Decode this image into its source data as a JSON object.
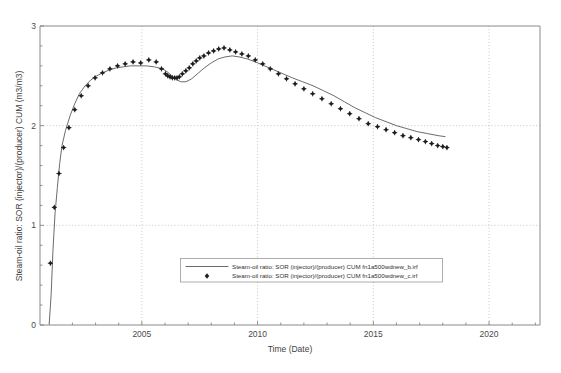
{
  "chart_data": {
    "type": "line",
    "title": "",
    "xlabel": "Time (Date)",
    "ylabel": "Steam-oil ratio: SOR (injector)/(producer) CUM (m3/m3)",
    "xlim": [
      2000.6,
      2022.2
    ],
    "ylim": [
      0,
      3
    ],
    "xticks": [
      2005,
      2010,
      2015,
      2020
    ],
    "xtick_labels": [
      "2005",
      "2010",
      "2015",
      "2020"
    ],
    "yticks": [
      0,
      1,
      2,
      3
    ],
    "ytick_labels": [
      "0",
      "1",
      "2",
      "3"
    ],
    "grid": true,
    "grid_style": "dotted",
    "legend_position": "lower-center-inside",
    "series": [
      {
        "name": "Steam-oil ratio: SOR (injector)/(producer) CUM fn1a500wdnew_b.irf",
        "style": "line",
        "color": "#5a5a5a",
        "x": [
          2001.0,
          2001.08,
          2001.16,
          2001.25,
          2001.35,
          2001.45,
          2001.55,
          2001.7,
          2001.9,
          2002.1,
          2002.3,
          2002.55,
          2002.8,
          2003.05,
          2003.3,
          2003.6,
          2003.9,
          2004.2,
          2004.5,
          2004.85,
          2005.2,
          2005.55,
          2005.9,
          2006.1,
          2006.3,
          2006.5,
          2006.7,
          2006.9,
          2007.15,
          2007.4,
          2007.7,
          2008.0,
          2008.3,
          2008.6,
          2008.9,
          2009.2,
          2009.55,
          2009.9,
          2010.3,
          2010.7,
          2011.1,
          2011.5,
          2011.95,
          2012.4,
          2012.85,
          2013.3,
          2013.75,
          2014.2,
          2014.65,
          2015.1,
          2015.55,
          2016.0,
          2016.45,
          2016.9,
          2017.35,
          2017.8,
          2018.1
        ],
        "y": [
          0.02,
          0.3,
          0.75,
          1.12,
          1.38,
          1.62,
          1.8,
          1.95,
          2.1,
          2.22,
          2.32,
          2.4,
          2.46,
          2.5,
          2.53,
          2.56,
          2.58,
          2.59,
          2.6,
          2.6,
          2.6,
          2.59,
          2.57,
          2.54,
          2.5,
          2.46,
          2.44,
          2.44,
          2.47,
          2.52,
          2.58,
          2.63,
          2.67,
          2.69,
          2.7,
          2.69,
          2.67,
          2.64,
          2.6,
          2.56,
          2.52,
          2.48,
          2.44,
          2.4,
          2.35,
          2.3,
          2.24,
          2.18,
          2.13,
          2.08,
          2.04,
          2.0,
          1.97,
          1.94,
          1.92,
          1.9,
          1.89
        ]
      },
      {
        "name": "Steam-oil ratio: SOR (injector)/(producer) CUM fn1a500wdnew_c.irf",
        "style": "markers",
        "marker": "diamond",
        "color": "#1f1f1f",
        "x": [
          2001.05,
          2001.22,
          2001.42,
          2001.62,
          2001.85,
          2002.1,
          2002.38,
          2002.68,
          2002.98,
          2003.3,
          2003.62,
          2003.95,
          2004.28,
          2004.62,
          2004.95,
          2005.3,
          2005.62,
          2005.85,
          2006.02,
          2006.12,
          2006.22,
          2006.32,
          2006.42,
          2006.52,
          2006.62,
          2006.75,
          2006.9,
          2007.05,
          2007.2,
          2007.35,
          2007.5,
          2007.68,
          2007.88,
          2008.1,
          2008.32,
          2008.55,
          2008.8,
          2009.05,
          2009.32,
          2009.6,
          2009.9,
          2010.22,
          2010.55,
          2010.9,
          2011.25,
          2011.62,
          2012.0,
          2012.38,
          2012.78,
          2013.18,
          2013.58,
          2013.98,
          2014.38,
          2014.78,
          2015.18,
          2015.55,
          2015.92,
          2016.28,
          2016.62,
          2016.95,
          2017.25,
          2017.52,
          2017.78,
          2018.0,
          2018.18
        ],
        "y": [
          0.62,
          1.18,
          1.52,
          1.78,
          1.98,
          2.16,
          2.3,
          2.4,
          2.48,
          2.53,
          2.57,
          2.6,
          2.62,
          2.64,
          2.63,
          2.66,
          2.64,
          2.57,
          2.52,
          2.5,
          2.49,
          2.48,
          2.48,
          2.48,
          2.49,
          2.52,
          2.55,
          2.58,
          2.62,
          2.65,
          2.68,
          2.7,
          2.73,
          2.75,
          2.77,
          2.78,
          2.76,
          2.74,
          2.72,
          2.7,
          2.66,
          2.62,
          2.57,
          2.52,
          2.47,
          2.42,
          2.37,
          2.32,
          2.27,
          2.22,
          2.17,
          2.12,
          2.07,
          2.02,
          1.99,
          1.96,
          1.93,
          1.9,
          1.88,
          1.86,
          1.84,
          1.82,
          1.8,
          1.79,
          1.78
        ]
      }
    ]
  },
  "legend": {
    "entries": [
      {
        "label": "Steam-oil ratio: SOR (injector)/(producer) CUM fn1a500wdnew_b.irf",
        "symbol": "line"
      },
      {
        "label": "Steam-oil ratio: SOR (injector)/(producer) CUM fn1a500wdnew_c.irf",
        "symbol": "diamond-marker"
      }
    ]
  },
  "caption": {
    "text": ""
  }
}
